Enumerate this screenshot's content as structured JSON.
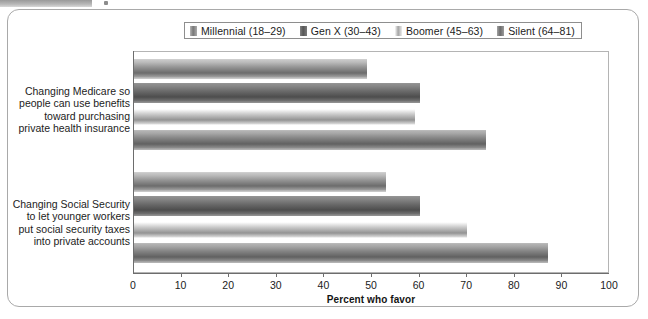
{
  "header": {
    "strip_label": "",
    "note": ""
  },
  "legend": {
    "position": "top-center",
    "items": [
      {
        "label": "Millennial (18–29)",
        "color": "#9a9a9a",
        "key": "millennial"
      },
      {
        "label": "Gen X (30–43)",
        "color": "#6e6e6e",
        "key": "genx"
      },
      {
        "label": "Boomer (45–63)",
        "color": "#d2d2d2",
        "key": "boomer"
      },
      {
        "label": "Silent (64–81)",
        "color": "#8a8a8a",
        "key": "silent"
      }
    ]
  },
  "chart_data": {
    "type": "bar",
    "orientation": "horizontal",
    "title": "",
    "subtitle": "",
    "xlabel": "Percent who favor",
    "ylabel": "",
    "xlim": [
      0,
      100
    ],
    "xticks": [
      0,
      10,
      20,
      30,
      40,
      50,
      60,
      70,
      80,
      90,
      100
    ],
    "grid": false,
    "legend_position": "top-center",
    "categories": [
      "Changing Medicare so people can use benefits toward purchasing private health insurance",
      "Changing Social Security to let younger workers put social security taxes into private accounts"
    ],
    "category_lines": [
      [
        "Changing Medicare so",
        "people can use benefits",
        "toward purchasing",
        "private health insurance"
      ],
      [
        "Changing Social Security",
        "to let younger workers",
        "put social security taxes",
        "into private accounts"
      ]
    ],
    "series": [
      {
        "name": "Millennial (18–29)",
        "color": "#9a9a9a",
        "values": [
          49,
          53
        ]
      },
      {
        "name": "Gen X (30–43)",
        "color": "#6e6e6e",
        "values": [
          60,
          60
        ]
      },
      {
        "name": "Boomer (45–63)",
        "color": "#d2d2d2",
        "values": [
          59,
          70
        ]
      },
      {
        "name": "Silent (64–81)",
        "color": "#8a8a8a",
        "values": [
          74,
          87
        ]
      }
    ]
  }
}
